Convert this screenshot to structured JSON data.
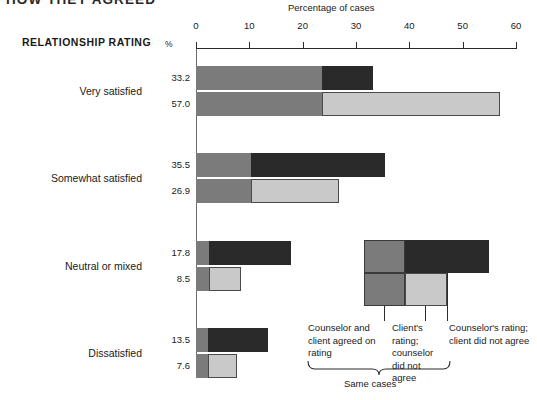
{
  "title_clipped": "HOW THEY AGREED",
  "axis": {
    "title": "Percentage of cases",
    "percent_symbol": "%",
    "row_header": "RELATIONSHIP RATING",
    "ticks": [
      0,
      10,
      20,
      30,
      40,
      50,
      60
    ],
    "tick_labels": [
      "0",
      "10",
      "20",
      "30",
      "40",
      "50",
      "60"
    ],
    "min": 0,
    "max": 60
  },
  "legend": {
    "items": [
      {
        "key": "agreed",
        "label": "Counselor and client agreed on rating",
        "color": "#7b7b7b"
      },
      {
        "key": "client",
        "label": "Client's rating; counselor did not agree",
        "color": "#c9c9c9"
      },
      {
        "key": "counselor",
        "label": "Counselor's rating; client did not agree",
        "color": "#2a2a2a"
      }
    ],
    "bracket_label": "Same cases"
  },
  "chart_data": {
    "type": "bar",
    "orientation": "horizontal",
    "stacked": true,
    "title": "HOW THEY AGREED",
    "xlabel": "Percentage of cases",
    "ylabel": "RELATIONSHIP RATING",
    "xlim": [
      0,
      60
    ],
    "xticks": [
      0,
      10,
      20,
      30,
      40,
      50,
      60
    ],
    "grid": false,
    "legend_position": "inside-right",
    "categories": [
      "Very satisfied",
      "Somewhat satisfied",
      "Neutral or mixed",
      "Dissatisfied"
    ],
    "series": [
      {
        "name": "Counselor and client agreed on rating",
        "color": "#7b7b7b",
        "values": [
          23.6,
          10.3,
          2.4,
          2.2
        ]
      },
      {
        "name": "Counselor's rating; client did not agree",
        "color": "#2a2a2a",
        "values": [
          9.6,
          25.2,
          15.4,
          11.3
        ]
      },
      {
        "name": "Client's rating; counselor did not agree",
        "color": "#c9c9c9",
        "values": [
          33.4,
          16.6,
          6.1,
          5.4
        ]
      }
    ],
    "bars": [
      {
        "category": "Very satisfied",
        "counselor_total": 33.2,
        "client_total": 57.0,
        "counselor_row": {
          "label": "33.2",
          "agreed": 23.6,
          "only": 9.6
        },
        "client_row": {
          "label": "57.0",
          "agreed": 23.6,
          "only": 33.4
        }
      },
      {
        "category": "Somewhat satisfied",
        "counselor_total": 35.5,
        "client_total": 26.9,
        "counselor_row": {
          "label": "35.5",
          "agreed": 10.3,
          "only": 25.2
        },
        "client_row": {
          "label": "26.9",
          "agreed": 10.3,
          "only": 16.6
        }
      },
      {
        "category": "Neutral or mixed",
        "counselor_total": 17.8,
        "client_total": 8.5,
        "counselor_row": {
          "label": "17.8",
          "agreed": 2.4,
          "only": 15.4
        },
        "client_row": {
          "label": "8.5",
          "agreed": 2.4,
          "only": 6.1
        }
      },
      {
        "category": "Dissatisfied",
        "counselor_total": 13.5,
        "client_total": 7.6,
        "counselor_row": {
          "label": "13.5",
          "agreed": 2.2,
          "only": 11.3
        },
        "client_row": {
          "label": "7.6",
          "agreed": 2.2,
          "only": 5.4
        }
      }
    ]
  }
}
